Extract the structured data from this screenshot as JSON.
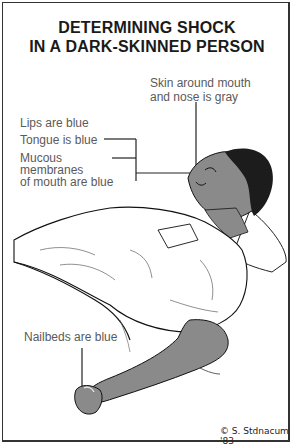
{
  "title": {
    "line1": "DETERMINING SHOCK",
    "line2": "IN A DARK-SKINNED PERSON"
  },
  "labels": {
    "skin": {
      "line1": "Skin around mouth",
      "line2": "and nose is gray"
    },
    "lips": "Lips are blue",
    "tongue": "Tongue is blue",
    "mucous": {
      "line1": "Mucous",
      "line2": "membranes",
      "line3": "of mouth are blue"
    },
    "nailbeds": "Nailbeds are blue"
  },
  "signature": "© S. Stdnacum '83",
  "colors": {
    "skin": "#8a8a8a",
    "hair": "#1c1c1c",
    "label_text": "#5a5a5a",
    "lines": "#222222"
  }
}
